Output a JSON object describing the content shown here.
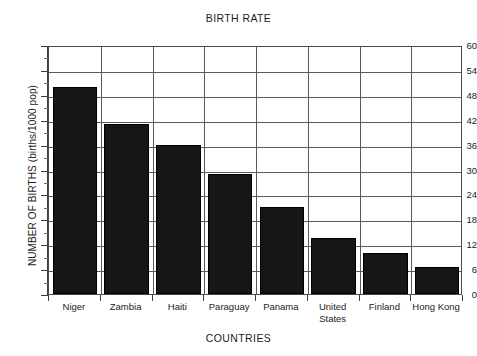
{
  "chart_data": {
    "type": "bar",
    "title": "BIRTH RATE",
    "xlabel": "COUNTRIES",
    "ylabel": "NUMBER OF BIRTHS (births/1000 pop)",
    "categories": [
      "Niger",
      "Zambia",
      "Haiti",
      "Paraguay",
      "Panama",
      "United States",
      "Finland",
      "Hong Kong"
    ],
    "values": [
      50,
      41,
      36,
      29,
      21,
      13.5,
      10,
      6.5
    ],
    "ylim": [
      0,
      60
    ],
    "ytick_step": 6,
    "ytick_labels": [
      "0",
      "6",
      "12",
      "18",
      "24",
      "30",
      "36",
      "42",
      "48",
      "54",
      "60"
    ],
    "ytick_values": [
      0,
      6,
      12,
      18,
      24,
      30,
      36,
      42,
      48,
      54,
      60
    ],
    "grid": "horizontal-and-vertical",
    "legend": "none",
    "bar_color": "#161616",
    "frame_color": "#4a4a4a",
    "background": "#ffffff"
  }
}
